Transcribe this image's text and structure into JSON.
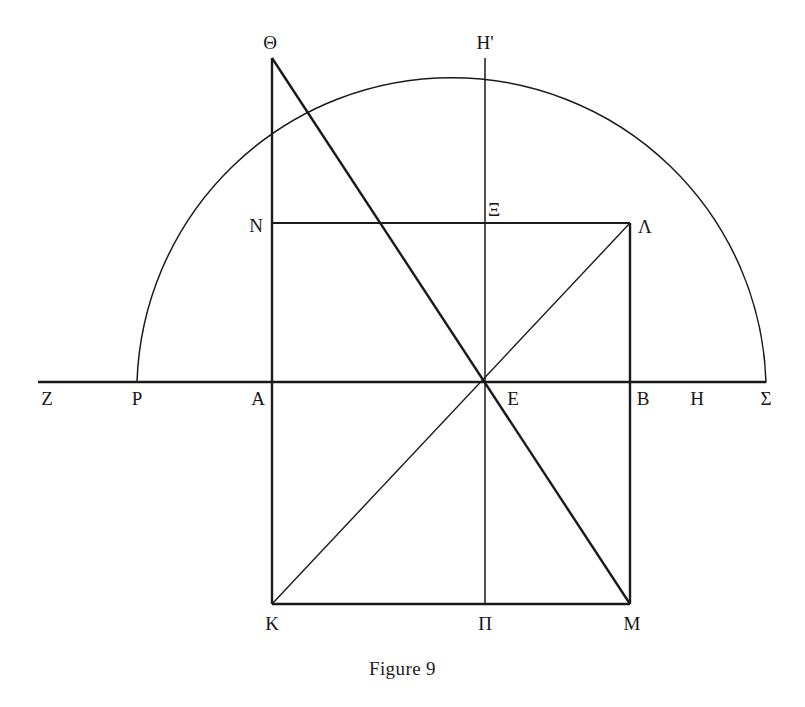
{
  "figure": {
    "caption": "Figure 9",
    "caption_x": 403,
    "caption_y": 658,
    "width": 805,
    "height": 707,
    "background_color": "#ffffff",
    "stroke_color": "#1a1a1a",
    "label_color": "#15161a"
  },
  "geometry": {
    "baseline": {
      "name": "Z-Sigma baseline",
      "x1": 38,
      "y1": 382,
      "x2": 766,
      "y2": 382,
      "weight": 2.6
    },
    "semicircle": {
      "name": "arc P to Sigma",
      "left_x": 137,
      "right_x": 766,
      "base_y": 382,
      "apex_x": 451,
      "apex_y": 57,
      "weight": 1.5
    },
    "rectangle": {
      "name": "rectangle A B M K",
      "left_x": 272,
      "right_x": 630,
      "top_y": 382,
      "bottom_y": 604,
      "weight": 2.4
    },
    "upper_vertical_theta": {
      "name": "segment Theta to A",
      "x": 272,
      "y1": 58,
      "y2": 382,
      "weight": 2.4
    },
    "upper_vertical_lambda": {
      "name": "segment Lambda to B",
      "x": 630,
      "y1": 223,
      "y2": 382,
      "weight": 2.4
    },
    "horizontal_n_lambda": {
      "name": "segment N to Lambda",
      "x1": 272,
      "x2": 630,
      "y": 223,
      "weight": 2.2
    },
    "vertical_hprime_pi": {
      "name": "segment H-prime to Pi",
      "x": 485,
      "y1": 58,
      "y2": 604,
      "weight": 1.5
    },
    "diagonal_theta_m": {
      "name": "diagonal Theta through E to M",
      "x1": 272,
      "y1": 58,
      "x2": 630,
      "y2": 604,
      "weight": 2.4
    },
    "diagonal_k_lambda": {
      "name": "diagonal K through E to Lambda",
      "x1": 272,
      "y1": 604,
      "x2": 630,
      "y2": 223,
      "weight": 1.4
    }
  },
  "points": [
    {
      "id": "Z",
      "label": "Z",
      "label_x": 47,
      "label_y": 398
    },
    {
      "id": "P",
      "label": "P",
      "label_x": 137,
      "label_y": 398
    },
    {
      "id": "A",
      "label": "A",
      "label_x": 258,
      "label_y": 398
    },
    {
      "id": "E",
      "label": "E",
      "label_x": 513,
      "label_y": 398
    },
    {
      "id": "B",
      "label": "B",
      "label_x": 643,
      "label_y": 398
    },
    {
      "id": "H",
      "label": "H",
      "label_x": 697,
      "label_y": 398
    },
    {
      "id": "S",
      "label": "Σ",
      "label_x": 766,
      "label_y": 398
    },
    {
      "id": "TH",
      "label": "Θ",
      "label_x": 270,
      "label_y": 42
    },
    {
      "id": "HP",
      "label": "H'",
      "label_x": 485,
      "label_y": 42
    },
    {
      "id": "N",
      "label": "N",
      "label_x": 256,
      "label_y": 225
    },
    {
      "id": "XI",
      "label": "Ξ",
      "label_x": 494,
      "label_y": 209
    },
    {
      "id": "L",
      "label": "Λ",
      "label_x": 645,
      "label_y": 226
    },
    {
      "id": "K",
      "label": "K",
      "label_x": 272,
      "label_y": 623
    },
    {
      "id": "PI",
      "label": "Π",
      "label_x": 485,
      "label_y": 623
    },
    {
      "id": "M",
      "label": "M",
      "label_x": 632,
      "label_y": 623
    }
  ]
}
